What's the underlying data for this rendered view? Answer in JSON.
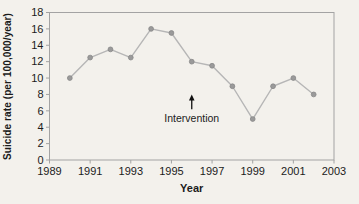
{
  "chart_data": {
    "type": "line",
    "title": "",
    "xlabel": "Year",
    "ylabel": "Suicide rate (per 100,000/year)",
    "x": [
      1990,
      1991,
      1992,
      1993,
      1994,
      1995,
      1996,
      1997,
      1998,
      1999,
      2000,
      2001,
      2002
    ],
    "values": [
      10,
      12.5,
      13.5,
      12.5,
      16,
      15.5,
      12,
      11.5,
      9,
      5,
      9,
      10,
      8
    ],
    "series_name": "Suicide rate",
    "xlim": [
      1989,
      2003
    ],
    "ylim": [
      0,
      18
    ],
    "xticks": [
      1989,
      1991,
      1993,
      1995,
      1997,
      1999,
      2001,
      2003
    ],
    "yticks": [
      0,
      2,
      4,
      6,
      8,
      10,
      12,
      14,
      16,
      18
    ],
    "grid": false,
    "legend": false,
    "annotation": {
      "label": "Intervention",
      "x": 1996,
      "arrow_tip_y": 8,
      "arrow_base_y": 6.2,
      "label_y": 4.6
    },
    "colors": {
      "background": "#f3f1ec",
      "axis": "#a3a3a3",
      "line": "#b6b6b6",
      "marker_fill": "#9a9a9a",
      "marker_edge": "#878787",
      "annotation": "#111111",
      "text": "#1b1b1b"
    }
  }
}
